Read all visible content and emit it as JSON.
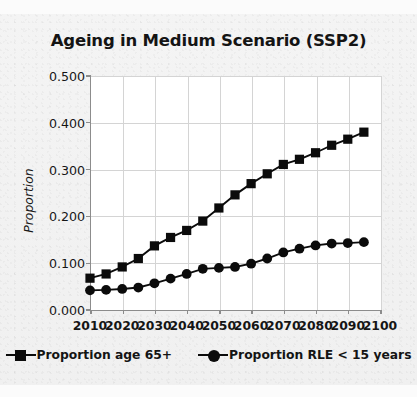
{
  "chart_data": {
    "type": "line",
    "title": "Ageing in Medium Scenario (SSP2)",
    "xlabel": "",
    "ylabel": "Proportion",
    "xlim": [
      2010,
      2100
    ],
    "ylim": [
      0.0,
      0.5
    ],
    "grid": true,
    "legend_position": "bottom",
    "x": [
      2010,
      2015,
      2020,
      2025,
      2030,
      2035,
      2040,
      2045,
      2050,
      2055,
      2060,
      2065,
      2070,
      2075,
      2080,
      2085,
      2090,
      2095
    ],
    "series": [
      {
        "name": "Proportion age 65+",
        "marker": "square",
        "color": "#0b0b0b",
        "values": [
          0.068,
          0.077,
          0.092,
          0.11,
          0.137,
          0.155,
          0.17,
          0.19,
          0.218,
          0.246,
          0.27,
          0.291,
          0.311,
          0.322,
          0.336,
          0.352,
          0.365,
          0.38
        ]
      },
      {
        "name": "Proportion RLE < 15 years",
        "marker": "circle",
        "color": "#0b0b0b",
        "values": [
          0.042,
          0.043,
          0.045,
          0.048,
          0.057,
          0.067,
          0.077,
          0.088,
          0.09,
          0.092,
          0.099,
          0.11,
          0.123,
          0.131,
          0.138,
          0.142,
          0.143,
          0.145
        ]
      }
    ],
    "ytick_labels": [
      "0.000",
      "0.100",
      "0.200",
      "0.300",
      "0.400",
      "0.500"
    ],
    "ytick_values": [
      0.0,
      0.1,
      0.2,
      0.3,
      0.4,
      0.5
    ],
    "xtick_labels": [
      "2010",
      "2020",
      "2030",
      "2040",
      "2050",
      "2060",
      "2070",
      "2080",
      "2090",
      "2100"
    ],
    "xtick_values": [
      2010,
      2020,
      2030,
      2040,
      2050,
      2060,
      2070,
      2080,
      2090,
      2100
    ]
  },
  "legend": {
    "entries": [
      {
        "label": "Proportion age 65+",
        "marker": "square"
      },
      {
        "label": "Proportion RLE < 15 years",
        "marker": "circle"
      }
    ]
  },
  "colors": {
    "series": "#0b0b0b",
    "axis": "#8c8c8c",
    "gridline": "#d4d4d4",
    "plot_background": "#ffffff",
    "page_background": "#f2f2f2",
    "text": "#141414"
  }
}
